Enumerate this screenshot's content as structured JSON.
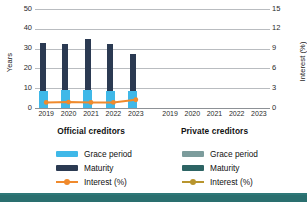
{
  "chart_data": {
    "type": "bar",
    "title": "",
    "categories": [
      "2019",
      "2020",
      "2021",
      "2022",
      "2023"
    ],
    "panels": [
      {
        "name": "Official creditors",
        "series": [
          {
            "name": "Grace period",
            "axis": "left",
            "unit": "Years",
            "color": "#3fb8e8",
            "values": [
              8.5,
              9.2,
              9.0,
              8.8,
              8.6
            ]
          },
          {
            "name": "Maturity",
            "axis": "left",
            "unit": "Years",
            "color": "#2b3a52",
            "values": [
              33.0,
              32.5,
              35.0,
              32.5,
              27.5
            ]
          },
          {
            "name": "Interest (%)",
            "axis": "right",
            "unit": "%",
            "color": "#f08a2c",
            "values": [
              0.85,
              0.9,
              0.85,
              0.85,
              1.25
            ]
          }
        ]
      },
      {
        "name": "Private creditors",
        "series": [
          {
            "name": "Grace period",
            "axis": "left",
            "unit": "Years",
            "color": "#7c9c9c",
            "values": [
              null,
              null,
              null,
              null,
              null
            ]
          },
          {
            "name": "Maturity",
            "axis": "left",
            "unit": "Years",
            "color": "#2d6464",
            "values": [
              null,
              null,
              null,
              null,
              null
            ]
          },
          {
            "name": "Interest (%)",
            "axis": "right",
            "unit": "%",
            "color": "#b8952e",
            "values": [
              null,
              null,
              null,
              null,
              null
            ]
          }
        ]
      }
    ],
    "ylabel": "Years",
    "ylabel_right": "Interest (%)",
    "xlabel": "",
    "ylim": [
      0,
      50
    ],
    "ylim_right": [
      0,
      15
    ],
    "yticks": [
      "50",
      "40",
      "30",
      "20",
      "10",
      "0"
    ],
    "yticks_right": [
      "15",
      "12",
      "9",
      "6",
      "3",
      "0"
    ],
    "grid": true,
    "legend_position": "bottom"
  },
  "axes": {
    "left_title": "Years",
    "right_title": "Interest (%)",
    "left_ticks": [
      "50",
      "40",
      "30",
      "20",
      "10",
      "0"
    ],
    "right_ticks": [
      "15",
      "12",
      "9",
      "6",
      "3",
      "0"
    ]
  },
  "xaxis": {
    "left": [
      "2019",
      "2020",
      "2021",
      "2022",
      "2023"
    ],
    "right": [
      "2019",
      "2020",
      "2021",
      "2022",
      "2023"
    ]
  },
  "captions": {
    "left": "Official creditors",
    "right": "Private creditors"
  },
  "legend": {
    "left": [
      {
        "label": "Grace period",
        "color": "#3fb8e8",
        "kind": "bar"
      },
      {
        "label": "Maturity",
        "color": "#2b3a52",
        "kind": "bar"
      },
      {
        "label": "Interest (%)",
        "color": "#f08a2c",
        "kind": "line"
      }
    ],
    "right": [
      {
        "label": "Grace period",
        "color": "#7c9c9c",
        "kind": "bar"
      },
      {
        "label": "Maturity",
        "color": "#2d6464",
        "kind": "bar"
      },
      {
        "label": "Interest (%)",
        "color": "#b8952e",
        "kind": "line"
      }
    ]
  },
  "colors": {
    "grace_official": "#3fb8e8",
    "maturity_official": "#2b3a52",
    "interest_official": "#f08a2c",
    "grace_private": "#7c9c9c",
    "maturity_private": "#2d6464",
    "interest_private": "#b8952e",
    "grid": "#b9bcc0",
    "band": "#2e7878"
  }
}
